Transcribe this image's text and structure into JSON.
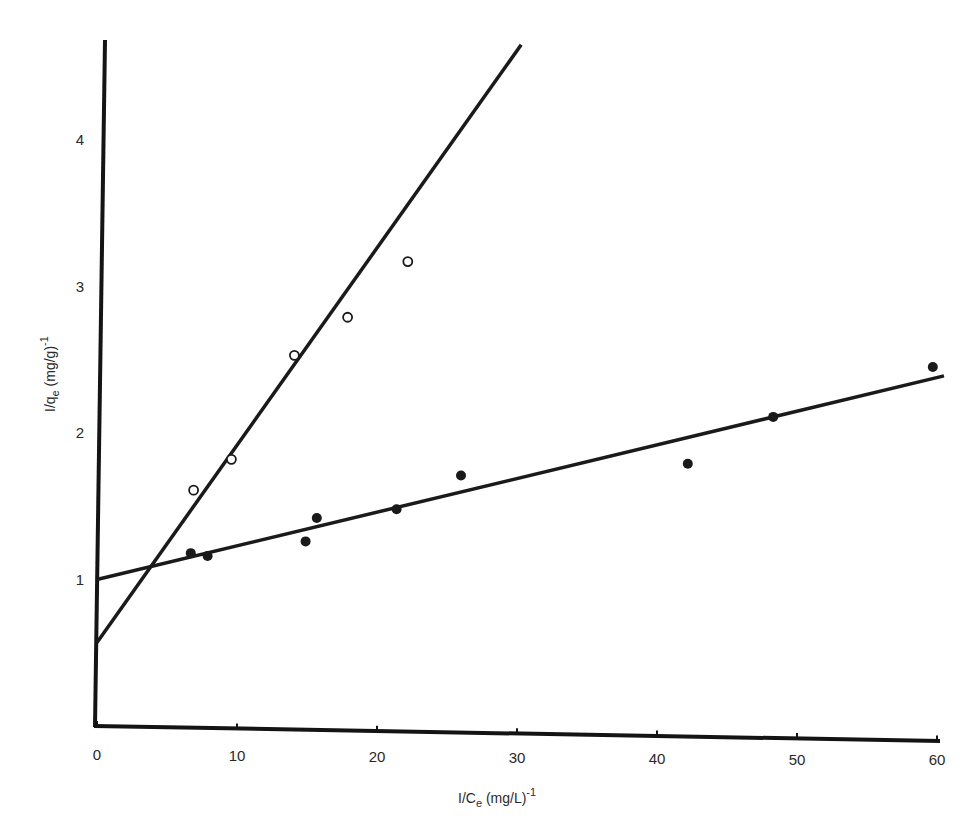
{
  "chart_data": {
    "type": "scatter",
    "title": "",
    "xlabel": "I/C_e (mg/L)^-1",
    "ylabel": "I/q_e (mg/g)^-1",
    "xlabel_parts": {
      "main": "I/C",
      "sub": "e",
      "rest": " (mg/L)",
      "sup": "-1"
    },
    "ylabel_parts": {
      "main": "I/q",
      "sub": "e",
      "rest": " (mg/g)",
      "sup": "-1"
    },
    "xlim": [
      0,
      61
    ],
    "ylim": [
      0,
      4.7
    ],
    "x_ticks": [
      0,
      10,
      20,
      30,
      40,
      50,
      60
    ],
    "x_tick_labels": [
      "0",
      "10",
      "20",
      "30",
      "40",
      "50",
      "60"
    ],
    "y_ticks": [
      1,
      2,
      3,
      4
    ],
    "y_tick_labels": [
      "1",
      "2",
      "3",
      "4"
    ],
    "grid": false,
    "legend": null,
    "series": [
      {
        "name": "filled circles",
        "marker": "filled-circle",
        "color": "#1a1a1a",
        "x": [
          6.7,
          7.9,
          14.9,
          15.7,
          21.4,
          26.0,
          42.2,
          48.3,
          59.7
        ],
        "y": [
          1.18,
          1.16,
          1.26,
          1.42,
          1.48,
          1.71,
          1.79,
          2.11,
          2.45
        ],
        "fit_line": {
          "x": [
            0,
            60.5
          ],
          "y": [
            1.0,
            2.39
          ]
        }
      },
      {
        "name": "open circles",
        "marker": "open-circle",
        "color": "#1a1a1a",
        "x": [
          6.9,
          9.6,
          14.1,
          17.9,
          22.2
        ],
        "y": [
          1.61,
          1.82,
          2.53,
          2.79,
          3.17
        ],
        "fit_line": {
          "x": [
            0,
            30.3
          ],
          "y": [
            0.57,
            4.65
          ]
        }
      }
    ]
  }
}
